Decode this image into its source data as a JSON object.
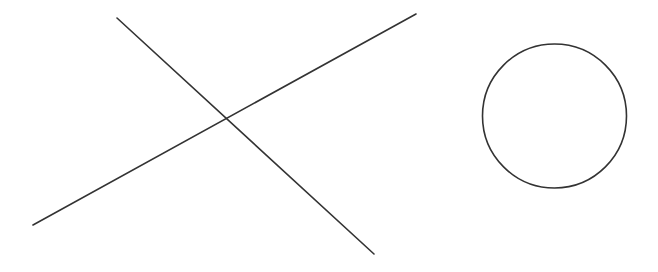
{
  "canvas": {
    "width": 658,
    "height": 272,
    "background": "#ffffff"
  },
  "style": {
    "stroke": "#333333",
    "stroke_width": 1.6
  },
  "shapes": {
    "line_a": {
      "x1": 117,
      "y1": 18,
      "x2": 374,
      "y2": 254
    },
    "line_b": {
      "x1": 33,
      "y1": 225,
      "x2": 416,
      "y2": 14
    },
    "circle": {
      "cx": 554.5,
      "cy": 116,
      "r": 72
    }
  }
}
